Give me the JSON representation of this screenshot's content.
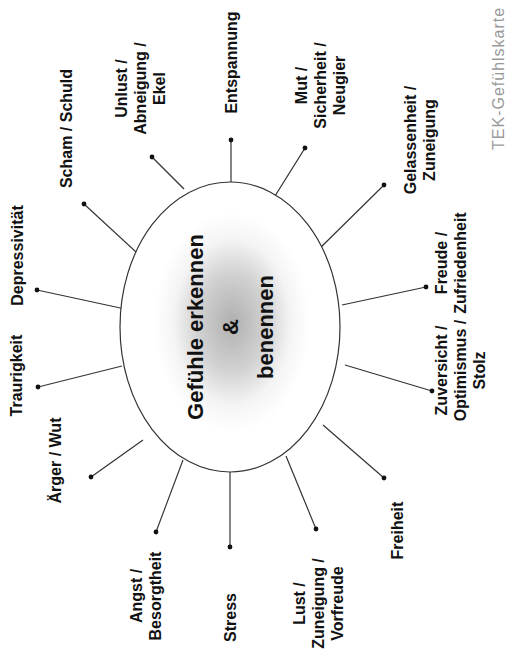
{
  "diagram": {
    "title_lines": [
      "Gefühle erkennen",
      "&",
      "benennen"
    ],
    "watermark": "TEK-Gefühlskarte",
    "center": {
      "cx": 230,
      "cy": 327,
      "rx": 110,
      "ry": 145
    },
    "colors": {
      "line": "#333333",
      "text": "#111111",
      "watermark": "#9a9a9a",
      "center_shadow": "#b5b5b5"
    },
    "spokes": [
      {
        "id": "entspannung",
        "lines": [
          "Entspannung"
        ],
        "dot": [
          231,
          140
        ],
        "edge": [
          231,
          182
        ],
        "label_pos": [
          231,
          62
        ]
      },
      {
        "id": "unlust",
        "lines": [
          "Unlust /",
          "Abneigung /",
          "Ekel"
        ],
        "dot": [
          152,
          157
        ],
        "edge": [
          184,
          189
        ],
        "label_pos": [
          140,
          88
        ]
      },
      {
        "id": "scham",
        "lines": [
          "Scham / Schuld"
        ],
        "dot": [
          84,
          204
        ],
        "edge": [
          148,
          263
        ],
        "label_pos": [
          66,
          128
        ]
      },
      {
        "id": "depressivitaet",
        "lines": [
          "Depressivität"
        ],
        "dot": [
          37,
          290
        ],
        "edge": [
          125,
          309
        ],
        "label_pos": [
          17,
          255
        ]
      },
      {
        "id": "traurigkeit",
        "lines": [
          "Traurigkeit"
        ],
        "dot": [
          38,
          387
        ],
        "edge": [
          122,
          366
        ],
        "label_pos": [
          17,
          375
        ]
      },
      {
        "id": "aerger",
        "lines": [
          "Ärger / Wut"
        ],
        "dot": [
          91,
          477
        ],
        "edge": [
          143,
          440
        ],
        "label_pos": [
          56,
          460
        ]
      },
      {
        "id": "angst",
        "lines": [
          "Angst /",
          "Besorgtheit"
        ],
        "dot": [
          156,
          532
        ],
        "edge": [
          183,
          460
        ],
        "label_pos": [
          146,
          596
        ]
      },
      {
        "id": "stress",
        "lines": [
          "Stress"
        ],
        "dot": [
          230,
          547
        ],
        "edge": [
          230,
          472
        ],
        "label_pos": [
          230,
          617
        ]
      },
      {
        "id": "lust",
        "lines": [
          "Lust /",
          "Zuneigung /",
          "Vorfreude"
        ],
        "dot": [
          316,
          529
        ],
        "edge": [
          286,
          456
        ],
        "label_pos": [
          318,
          603
        ]
      },
      {
        "id": "freiheit",
        "lines": [
          "Freiheit"
        ],
        "dot": [
          384,
          478
        ],
        "edge": [
          323,
          425
        ],
        "label_pos": [
          398,
          530
        ]
      },
      {
        "id": "zuversicht",
        "lines": [
          "Zuversicht /",
          "Optimismus /",
          "Stolz"
        ],
        "dot": [
          432,
          391
        ],
        "edge": [
          345,
          365
        ],
        "label_pos": [
          460,
          370
        ]
      },
      {
        "id": "freude",
        "lines": [
          "Freude /",
          "Zufriedenheit"
        ],
        "dot": [
          426,
          287
        ],
        "edge": [
          342,
          305
        ],
        "label_pos": [
          450,
          263
        ]
      },
      {
        "id": "gelassenheit",
        "lines": [
          "Gelassenheit /",
          "Zuneigung"
        ],
        "dot": [
          384,
          185
        ],
        "edge": [
          313,
          255
        ],
        "label_pos": [
          420,
          140
        ]
      },
      {
        "id": "mut",
        "lines": [
          "Mut /",
          "Sicherheit /",
          "Neugier"
        ],
        "dot": [
          305,
          148
        ],
        "edge": [
          275,
          196
        ],
        "label_pos": [
          320,
          85
        ]
      }
    ]
  }
}
